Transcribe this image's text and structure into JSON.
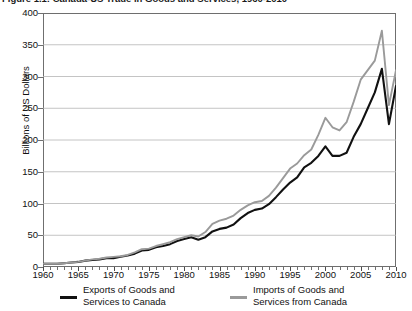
{
  "figure": {
    "title": "Figure 1.1: Canada-US Trade in Goods and Services, 1960-2010"
  },
  "chart_data": {
    "type": "line",
    "title": "Figure 1.1: Canada-US Trade in Goods and Services, 1960-2010",
    "xlabel": "",
    "ylabel": "Billions of US Dollars",
    "xlim": [
      1960,
      2010
    ],
    "ylim": [
      0,
      400
    ],
    "ytick_labels": [
      "0",
      "50",
      "100",
      "150",
      "200",
      "250",
      "300",
      "350",
      "400"
    ],
    "ytick_values": [
      0,
      50,
      100,
      150,
      200,
      250,
      300,
      350,
      400
    ],
    "xtick_labels": [
      "1960",
      "1965",
      "1970",
      "1975",
      "1980",
      "1985",
      "1990",
      "1995",
      "2000",
      "2005",
      "2010"
    ],
    "xtick_values": [
      1960,
      1965,
      1970,
      1975,
      1980,
      1985,
      1990,
      1995,
      2000,
      2005,
      2010
    ],
    "grid": "horizontal",
    "legend_position": "below",
    "x": [
      1960,
      1961,
      1962,
      1963,
      1964,
      1965,
      1966,
      1967,
      1968,
      1969,
      1970,
      1971,
      1972,
      1973,
      1974,
      1975,
      1976,
      1977,
      1978,
      1979,
      1980,
      1981,
      1982,
      1983,
      1984,
      1985,
      1986,
      1987,
      1988,
      1989,
      1990,
      1991,
      1992,
      1993,
      1994,
      1995,
      1996,
      1997,
      1998,
      1999,
      2000,
      2001,
      2002,
      2003,
      2004,
      2005,
      2006,
      2007,
      2008,
      2009,
      2010
    ],
    "series": [
      {
        "name": "Exports of Goods and Services to Canada",
        "color": "#111111",
        "values": [
          5,
          5,
          5,
          6,
          7,
          8,
          10,
          11,
          12,
          14,
          14,
          16,
          18,
          21,
          26,
          27,
          31,
          33,
          36,
          41,
          44,
          47,
          43,
          47,
          56,
          60,
          62,
          67,
          77,
          85,
          90,
          92,
          99,
          110,
          122,
          133,
          141,
          157,
          164,
          175,
          190,
          175,
          175,
          180,
          205,
          225,
          250,
          275,
          312,
          225,
          285
        ]
      },
      {
        "name": "Imports of Goods and Services from Canada",
        "color": "#9a9a9a",
        "values": [
          5,
          5,
          5,
          6,
          7,
          8,
          10,
          12,
          13,
          15,
          16,
          17,
          19,
          23,
          28,
          29,
          33,
          36,
          39,
          44,
          47,
          50,
          48,
          55,
          68,
          73,
          76,
          81,
          90,
          97,
          102,
          104,
          112,
          125,
          140,
          155,
          163,
          176,
          185,
          208,
          235,
          220,
          215,
          228,
          260,
          295,
          310,
          325,
          372,
          255,
          310
        ]
      }
    ]
  },
  "axes": {
    "y_title": "Billions of US Dollars"
  },
  "legend": {
    "entries": [
      {
        "line1": "Exports of Goods and",
        "line2": "Services to Canada",
        "color": "#111111"
      },
      {
        "line1": "Imports of Goods and",
        "line2": "Services from Canada",
        "color": "#9a9a9a"
      }
    ]
  }
}
